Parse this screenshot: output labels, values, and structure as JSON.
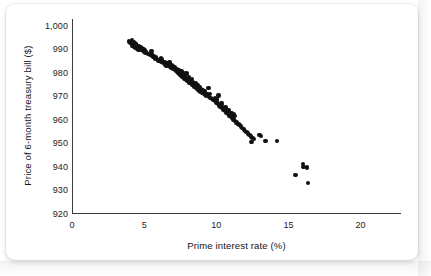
{
  "chart_data": {
    "type": "scatter",
    "title": "",
    "xlabel": "Prime interest rate (%)",
    "ylabel": "Price of 6-month treasury bill ($)",
    "xlim": [
      0,
      22.8
    ],
    "ylim": [
      920,
      1003
    ],
    "xticks": [
      0,
      5,
      10,
      15,
      20
    ],
    "xtick_labels": [
      "0",
      "5",
      "10",
      "15",
      "20"
    ],
    "yticks": [
      920,
      930,
      940,
      950,
      960,
      970,
      980,
      990,
      1000
    ],
    "ytick_labels": [
      "920",
      "930",
      "940",
      "950",
      "960",
      "970",
      "980",
      "990",
      "1,000"
    ],
    "grid": false,
    "legend": null,
    "marker_color": "#111111",
    "axis_color": "#3b3b3b",
    "series": [
      {
        "name": "Treasury bill price vs prime rate",
        "x": [
          3.95,
          4.05,
          4.1,
          4.15,
          4.2,
          4.2,
          4.25,
          4.3,
          4.3,
          4.35,
          4.4,
          4.4,
          4.45,
          4.5,
          4.55,
          4.6,
          4.6,
          4.65,
          4.7,
          4.75,
          4.8,
          4.85,
          4.9,
          4.95,
          5.0,
          5.05,
          5.1,
          5.2,
          5.3,
          5.4,
          5.5,
          5.55,
          5.6,
          5.7,
          5.75,
          5.8,
          5.9,
          6.0,
          6.1,
          6.15,
          6.2,
          6.3,
          6.4,
          6.45,
          6.5,
          6.6,
          6.7,
          6.75,
          6.8,
          6.9,
          6.95,
          7.0,
          7.05,
          7.1,
          7.15,
          7.2,
          7.25,
          7.3,
          7.35,
          7.4,
          7.45,
          7.5,
          7.55,
          7.6,
          7.65,
          7.7,
          7.75,
          7.8,
          7.85,
          7.9,
          7.95,
          8.0,
          8.05,
          8.1,
          8.15,
          8.2,
          8.25,
          8.3,
          8.35,
          8.4,
          8.45,
          8.5,
          8.55,
          8.6,
          8.65,
          8.7,
          8.75,
          8.8,
          8.85,
          8.9,
          8.95,
          9.0,
          9.05,
          9.1,
          9.15,
          9.2,
          9.25,
          9.3,
          9.4,
          9.5,
          9.55,
          9.6,
          9.7,
          9.8,
          9.9,
          10.0,
          10.05,
          10.1,
          10.2,
          10.3,
          10.35,
          10.4,
          10.5,
          10.6,
          10.65,
          10.7,
          10.8,
          10.85,
          10.9,
          11.0,
          11.05,
          11.1,
          11.2,
          11.25,
          11.3,
          11.4,
          11.5,
          11.6,
          11.7,
          11.8,
          11.9,
          12.0,
          12.1,
          12.2,
          12.3,
          12.4,
          12.5,
          12.6,
          13.0,
          13.1,
          13.4,
          14.2,
          15.5,
          16.0,
          16.05,
          16.3,
          16.35,
          5.55,
          6.2,
          7.0,
          7.6,
          8.1,
          8.6,
          9.2,
          9.9,
          10.4,
          11.2,
          4.45,
          5.1,
          6.55,
          7.3,
          8.3,
          9.45,
          10.15,
          11.55,
          12.45,
          7.85
        ],
        "y": [
          993.5,
          993.0,
          992.8,
          994.0,
          992.5,
          991.5,
          993.2,
          992.0,
          991.0,
          992.6,
          991.8,
          990.8,
          992.2,
          991.2,
          990.5,
          991.6,
          990.0,
          991.0,
          990.2,
          990.8,
          989.8,
          990.4,
          989.5,
          990.0,
          989.2,
          989.8,
          989.0,
          988.6,
          988.2,
          987.8,
          989.5,
          987.4,
          986.8,
          987.0,
          986.2,
          986.6,
          986.0,
          985.4,
          985.0,
          986.2,
          984.6,
          984.2,
          984.8,
          983.6,
          983.2,
          983.8,
          983.0,
          984.5,
          982.6,
          982.2,
          983.4,
          982.0,
          981.6,
          982.4,
          981.2,
          980.8,
          981.8,
          980.4,
          980.0,
          981.0,
          979.6,
          979.2,
          980.2,
          978.8,
          978.4,
          979.4,
          978.0,
          977.6,
          978.8,
          977.2,
          979.8,
          976.8,
          977.8,
          976.4,
          975.8,
          976.0,
          977.0,
          975.4,
          975.0,
          976.2,
          974.6,
          974.2,
          975.6,
          973.8,
          973.4,
          974.8,
          973.0,
          972.6,
          974.0,
          972.2,
          973.2,
          971.8,
          972.8,
          971.4,
          971.0,
          972.0,
          970.6,
          970.2,
          970.8,
          969.8,
          971.2,
          969.4,
          969.0,
          968.6,
          968.0,
          967.4,
          968.8,
          966.8,
          966.2,
          965.6,
          967.2,
          965.0,
          964.4,
          963.8,
          965.4,
          963.2,
          962.6,
          964.0,
          962.0,
          961.4,
          963.0,
          960.8,
          960.2,
          961.6,
          959.6,
          959.0,
          958.4,
          957.8,
          957.2,
          956.6,
          956.0,
          955.4,
          954.8,
          954.2,
          953.6,
          953.0,
          952.4,
          951.8,
          953.6,
          953.2,
          951.0,
          951.2,
          936.6,
          941.2,
          940.0,
          939.8,
          933.2,
          988.2,
          985.8,
          983.0,
          980.6,
          978.2,
          975.2,
          972.4,
          969.2,
          966.4,
          962.4,
          992.4,
          988.8,
          984.0,
          981.4,
          977.4,
          973.6,
          970.4,
          958.2,
          950.6,
          980.0
        ],
        "n_points": 177,
        "x_range": [
          3.95,
          16.35
        ],
        "y_range": [
          933.2,
          994.0
        ],
        "relationship": "strong negative linear association"
      }
    ],
    "annotations": []
  },
  "figure": {
    "background_color": "#ffffff",
    "card_border_radius": "9px"
  }
}
